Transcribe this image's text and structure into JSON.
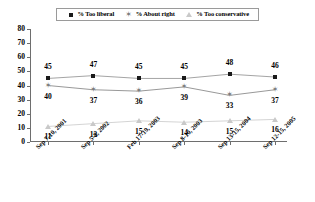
{
  "chart_data": {
    "type": "line",
    "title": "",
    "xlabel": "",
    "ylabel": "",
    "ylim": [
      0,
      80
    ],
    "yticks": [
      0,
      10,
      20,
      30,
      40,
      50,
      60,
      70,
      80
    ],
    "grid": false,
    "legend_position": "top",
    "categories": [
      "Sep 7-10, 2001",
      "Sep 5-8, 2002",
      "Feb 17-19, 2003",
      "Sep 8-10, 2003",
      "Sep 13-15, 2004",
      "Sep 12-15, 2005"
    ],
    "series": [
      {
        "name": "% Too liberal",
        "marker": "square-icon",
        "color": "#1a1a1a",
        "label_position": "above",
        "values": [
          45,
          47,
          45,
          45,
          48,
          46
        ]
      },
      {
        "name": "% About right",
        "marker": "star-icon",
        "color": "#7d7d7d",
        "label_position": "below",
        "values": [
          40,
          37,
          36,
          39,
          33,
          37
        ]
      },
      {
        "name": "% Too conservative",
        "marker": "triangle-icon",
        "color": "#c9c9c9",
        "label_position": "below",
        "values": [
          11,
          13,
          15,
          14,
          15,
          16
        ]
      }
    ]
  },
  "legend": {
    "entries": [
      {
        "label": "% Too liberal",
        "marker": "square-icon"
      },
      {
        "label": "% About right",
        "marker": "star-icon"
      },
      {
        "label": "% Too conservative",
        "marker": "triangle-icon"
      }
    ]
  },
  "axis": {
    "y_tick_labels": [
      "80",
      "70",
      "60",
      "50",
      "40",
      "30",
      "20",
      "10",
      "0"
    ]
  },
  "colors": {
    "series_1": "#1a1a1a",
    "series_2": "#7d7d7d",
    "series_3": "#c9c9c9",
    "axis": "#6e6e6e",
    "background": "#ffffff"
  }
}
